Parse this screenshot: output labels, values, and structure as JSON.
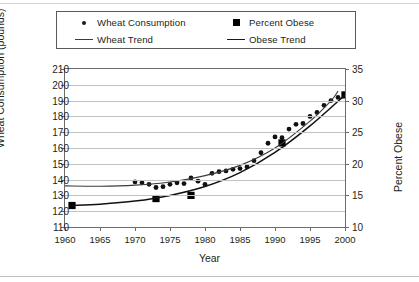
{
  "chart_data": {
    "type": "scatter",
    "title": "",
    "xlabel": "Year",
    "ylabel": "Wheat Consumption (pounds)",
    "y2label": "Percent Obese",
    "xlim": [
      1960,
      2000
    ],
    "ylim": [
      110,
      210
    ],
    "y2lim": [
      10,
      35
    ],
    "grid": true,
    "legend_position": "top",
    "xticks": [
      1960,
      1965,
      1970,
      1975,
      1980,
      1985,
      1990,
      1995,
      2000
    ],
    "yticks": [
      110,
      120,
      130,
      140,
      150,
      160,
      170,
      180,
      190,
      200,
      210
    ],
    "y2ticks": [
      10,
      15,
      20,
      25,
      30,
      35
    ],
    "series": [
      {
        "name": "Wheat Consumption",
        "marker": "circle",
        "axis": "left",
        "color": "#111111",
        "points": [
          [
            1970,
            138.5
          ],
          [
            1971,
            138.0
          ],
          [
            1972,
            137.0
          ],
          [
            1973,
            135.0
          ],
          [
            1974,
            135.5
          ],
          [
            1975,
            137.0
          ],
          [
            1976,
            138.0
          ],
          [
            1977,
            137.5
          ],
          [
            1978,
            141.0
          ],
          [
            1979,
            139.0
          ],
          [
            1980,
            137.0
          ],
          [
            1981,
            144.0
          ],
          [
            1982,
            145.0
          ],
          [
            1983,
            145.5
          ],
          [
            1984,
            146.5
          ],
          [
            1985,
            147.0
          ],
          [
            1986,
            148.0
          ],
          [
            1987,
            152.0
          ],
          [
            1988,
            157.0
          ],
          [
            1989,
            163.0
          ],
          [
            1990,
            167.0
          ],
          [
            1991,
            166.5
          ],
          [
            1992,
            172.0
          ],
          [
            1993,
            175.0
          ],
          [
            1994,
            175.5
          ],
          [
            1995,
            180.0
          ],
          [
            1996,
            182.5
          ],
          [
            1997,
            187.0
          ],
          [
            1998,
            190.0
          ],
          [
            1999,
            192.0
          ]
        ]
      },
      {
        "name": "Percent Obese",
        "marker": "square",
        "axis": "right",
        "color": "#000000",
        "points": [
          [
            1961,
            13.4
          ],
          [
            1973,
            14.5
          ],
          [
            1978,
            15.0
          ],
          [
            1991,
            23.3
          ],
          [
            2000,
            30.9
          ]
        ]
      },
      {
        "name": "Wheat Trend",
        "marker": "line",
        "axis": "left",
        "color": "#3b3b3b",
        "points": [
          [
            1960,
            136.0
          ],
          [
            1965,
            135.8
          ],
          [
            1970,
            136.5
          ],
          [
            1975,
            138.5
          ],
          [
            1980,
            142.5
          ],
          [
            1985,
            149.0
          ],
          [
            1990,
            160.0
          ],
          [
            1995,
            177.0
          ],
          [
            1998,
            190.0
          ],
          [
            1999,
            196.0
          ]
        ]
      },
      {
        "name": "Obese Trend",
        "marker": "line",
        "axis": "right",
        "color": "#111111",
        "points": [
          [
            1961,
            13.4
          ],
          [
            1965,
            13.6
          ],
          [
            1970,
            14.1
          ],
          [
            1975,
            15.0
          ],
          [
            1980,
            16.4
          ],
          [
            1985,
            18.6
          ],
          [
            1990,
            21.8
          ],
          [
            1995,
            26.0
          ],
          [
            2000,
            30.9
          ]
        ]
      }
    ],
    "legend_entries": [
      {
        "label": "Wheat Consumption",
        "key": "dot-marker"
      },
      {
        "label": "Percent Obese",
        "key": "square-marker"
      },
      {
        "label": "Wheat Trend",
        "key": "line-marker"
      },
      {
        "label": "Obese Trend",
        "key": "line-marker"
      }
    ]
  },
  "legend": {
    "wheat_consumption": "Wheat Consumption",
    "percent_obese": "Percent Obese",
    "wheat_trend": "Wheat Trend",
    "obese_trend": "Obese Trend"
  },
  "axes": {
    "left_title": "Wheat Consumption (pounds)",
    "right_title": "Percent Obese",
    "x_title": "Year"
  },
  "colors": {
    "frame": "#6b6b6b",
    "grid": "#c2c2c2",
    "marker": "#111111",
    "trend_wheat": "#3b3b3b",
    "trend_obese": "#111111",
    "text": "#231f20"
  }
}
